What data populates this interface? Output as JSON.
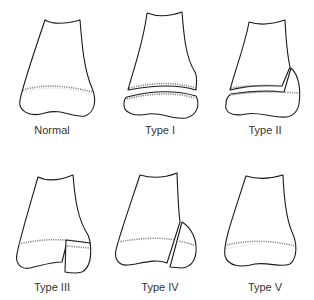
{
  "figure": {
    "panels": [
      {
        "id": "normal",
        "label": "Normal"
      },
      {
        "id": "type1",
        "label": "Type I"
      },
      {
        "id": "type2",
        "label": "Type II"
      },
      {
        "id": "type3",
        "label": "Type III"
      },
      {
        "id": "type4",
        "label": "Type IV"
      },
      {
        "id": "type5",
        "label": "Type V"
      }
    ],
    "colors": {
      "outline": "#1a1a1a",
      "physis": "#8a8a8a",
      "background": "#ffffff"
    }
  }
}
